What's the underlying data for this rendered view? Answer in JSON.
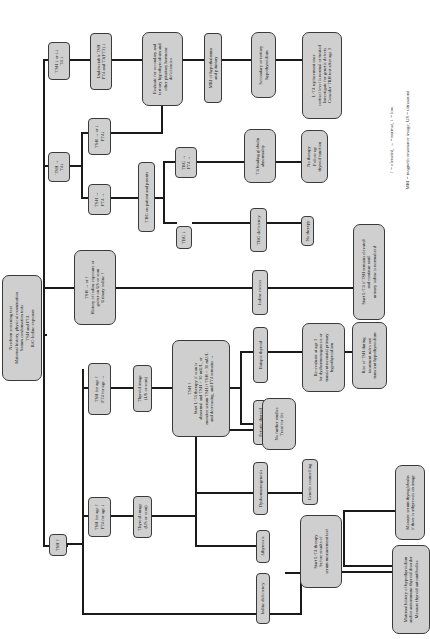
{
  "diagram": {
    "type": "flowchart",
    "orientation": "rotated-90-ccw",
    "root": {
      "lines": [
        "Newborn screening test",
        "Maternal history, physical examination",
        "Serum confirmation tests",
        "TSH and FT4",
        "R/O Iodine exposure"
      ]
    },
    "branches": {
      "tsh_low": {
        "lines": [
          "TSH ↓ or ↓↓",
          "T4 ↓"
        ]
      },
      "tsh_normal_t4_low": {
        "lines": [
          "TSH →",
          "T4↓"
        ]
      },
      "tsh_high": {
        "lines": [
          "TSH ↑"
        ]
      },
      "iodine": {
        "lines": [
          "TSH → or ↑",
          "History of iodine exposure or",
          "goiter on US or scan",
          "Urinary iodine ↑"
        ]
      }
    },
    "nodes": {
      "undetectable": {
        "lines": [
          "Undetectable TSH",
          "FT4 and T3(FT3) ↓"
        ]
      },
      "tsh_n_ft4_low": {
        "lines": [
          "TSH → or ↓",
          "FT4↓"
        ]
      },
      "tsh_n_ft4_n": {
        "lines": [
          "TSH →",
          "FT4 →"
        ]
      },
      "evaluate": {
        "lines": [
          "Evaluate for secondary and",
          "tertiary hypothyroidism and",
          "other pituitary hormone",
          "deficiencies"
        ]
      },
      "tbg_test": {
        "lines": [
          "TBG on patient and parents"
        ]
      },
      "tbg_n": {
        "lines": [
          "TBG →",
          "FT4 →"
        ]
      },
      "tbg_low": {
        "lines": [
          "TBG ↓"
        ]
      },
      "mri": {
        "lines": [
          "MRI of hypothalamus",
          "and pituitary"
        ]
      },
      "t4bg": {
        "lines": [
          "T4 binding globulin",
          "abnormality"
        ]
      },
      "tbg_def": {
        "lines": [
          "TBG deficiency"
        ]
      },
      "iodine_excess": {
        "lines": [
          "Iodine excess"
        ]
      },
      "secondary": {
        "lines": [
          "Secondary or tertiary",
          "hypothyroidism"
        ]
      },
      "lt4_replacement": {
        "lines": [
          "L-T4 replacement once",
          "cortisol level is normal or treated",
          "Investigate for genetic defects",
          "Consider TRH test after age 3"
        ]
      },
      "no_therapy_follow": {
        "lines": [
          "No therapy",
          "Follow up",
          "thyroid function"
        ]
      },
      "no_therapy": {
        "lines": [
          "No therapy"
        ]
      },
      "start_lt4_iodine": {
        "lines": [
          "Start L-T4 if TSH remains elevated",
          "and continue until",
          "urinary iodine is normalized"
        ]
      },
      "tsh_age_ft4_n": {
        "lines": [
          "TSH for age ↑",
          "FT4 for age →"
        ]
      },
      "tsh_age_ft4_low": {
        "lines": [
          "TSH for age ↑",
          "FT4 for age ↓"
        ]
      },
      "thyroid_image_1": {
        "lines": [
          "Thyroid image",
          "(US or scan)"
        ]
      },
      "thyroid_image_2": {
        "lines": [
          "Thyroid image",
          "(US or scan)"
        ]
      },
      "tsh_start_lt4": {
        "lines": [
          "TSH ↑",
          "Start L-T4 therapy if scan is",
          "abnormal and TSH > 30 mU/L, or",
          "monitor serum TSH if TSH < 30 mU/L",
          "and decreasing, and FT4 remains →"
        ]
      },
      "eutopic": {
        "lines": [
          "Eutopic thyroid"
        ]
      },
      "ectopic": {
        "lines": [
          "Ectopic thyroid"
        ]
      },
      "no_further": {
        "lines": [
          "No further studies",
          "Treat for life"
        ]
      },
      "reevaluate": {
        "lines": [
          "Re-evaluate at age 3",
          "for dyshormonogenesis or",
          "transient neonatal primary",
          "hypothyroidism"
        ]
      },
      "rise_tsh": {
        "lines": [
          "Rise of TSH during",
          "treatment rules out",
          "transient hypothyroidism"
        ]
      },
      "dyshormonogenesis": {
        "lines": [
          "Dyshormonogenesis"
        ]
      },
      "genetic": {
        "lines": [
          "Genetic counselling"
        ]
      },
      "athyreosis": {
        "lines": [
          "Athyreosis"
        ]
      },
      "start_lt4_before": {
        "lines": [
          "Start L-T4 therapy",
          "before results of",
          "serum measurement test"
        ]
      },
      "iodine_deficiency": {
        "lines": [
          "Iodine deficiency"
        ]
      },
      "thyroglobulin": {
        "lines": [
          "Measure serum thyroglobulin",
          "if there is athyreosis on image"
        ]
      },
      "maternal": {
        "lines": [
          "Maternal history of hypothyroidism",
          "and/or autoimmune thyroid disorder",
          "Measure thyroid autoantibodies"
        ]
      }
    },
    "legend": {
      "line1": "↑ = elevated, → = normal, ↓ = low",
      "line2": "MRI = magnetic resonance image, US = ultrasound"
    }
  }
}
